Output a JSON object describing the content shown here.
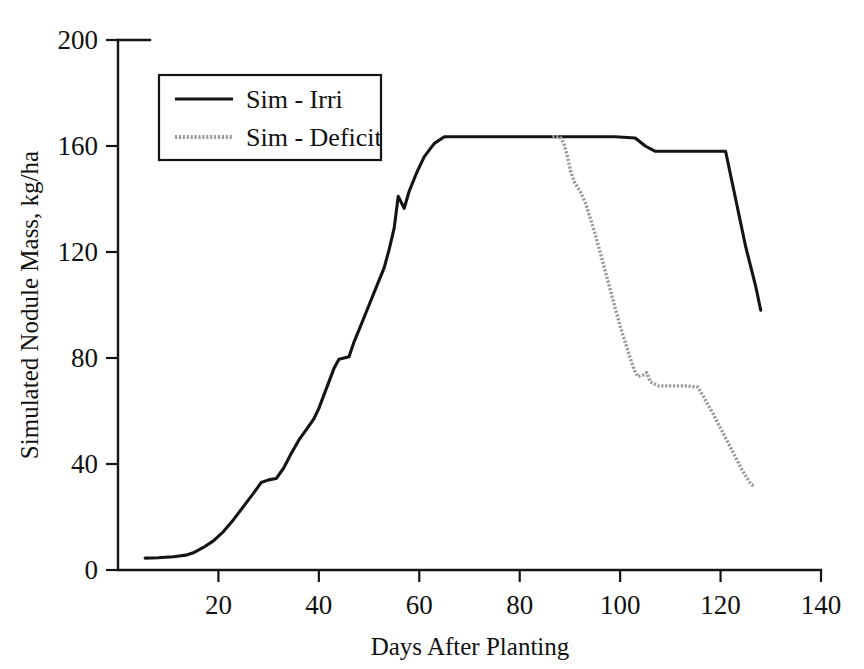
{
  "chart_data": {
    "type": "line",
    "title": "",
    "xlabel": "Days After Planting",
    "ylabel": "Simulated Nodule Mass, kg/ha",
    "xlim": [
      0,
      140
    ],
    "ylim": [
      0,
      200
    ],
    "xticks": [
      0,
      20,
      40,
      60,
      80,
      100,
      120,
      140
    ],
    "xtick_labels": [
      "0",
      "20",
      "40",
      "60",
      "80",
      "100",
      "120",
      "140"
    ],
    "yticks": [
      0,
      40,
      80,
      120,
      160,
      200
    ],
    "ytick_labels": [
      "0",
      "40",
      "80",
      "120",
      "160",
      "200"
    ],
    "grid": false,
    "legend_position": "upper left",
    "series": [
      {
        "name": "Sim - Irri",
        "style": "solid",
        "color": "#141414",
        "points": [
          [
            5.4,
            4.5
          ],
          [
            8,
            4.6
          ],
          [
            11,
            5.0
          ],
          [
            13.5,
            5.6
          ],
          [
            15,
            6.5
          ],
          [
            17,
            8.5
          ],
          [
            19,
            11.0
          ],
          [
            21,
            14.5
          ],
          [
            23,
            19.0
          ],
          [
            25,
            24.0
          ],
          [
            27,
            29.0
          ],
          [
            28.5,
            33.0
          ],
          [
            30,
            34.0
          ],
          [
            31.5,
            34.5
          ],
          [
            33,
            38.5
          ],
          [
            34.5,
            44.0
          ],
          [
            36,
            49.0
          ],
          [
            37.5,
            53.0
          ],
          [
            39,
            57.0
          ],
          [
            40,
            61.0
          ],
          [
            41,
            66.0
          ],
          [
            42,
            71.0
          ],
          [
            43,
            76.0
          ],
          [
            44,
            79.5
          ],
          [
            45,
            80.0
          ],
          [
            46,
            80.5
          ],
          [
            47,
            86.0
          ],
          [
            48.5,
            93.0
          ],
          [
            50,
            100.0
          ],
          [
            51.5,
            107.0
          ],
          [
            53,
            114.0
          ],
          [
            54,
            121.0
          ],
          [
            55,
            129.0
          ],
          [
            55.8,
            141.0
          ],
          [
            57,
            136.5
          ],
          [
            58,
            143.0
          ],
          [
            59.5,
            150.0
          ],
          [
            61,
            156.0
          ],
          [
            63,
            161.0
          ],
          [
            65,
            163.5
          ],
          [
            68,
            163.5
          ],
          [
            72,
            163.5
          ],
          [
            78,
            163.5
          ],
          [
            84,
            163.5
          ],
          [
            88,
            163.5
          ],
          [
            94,
            163.5
          ],
          [
            99,
            163.5
          ],
          [
            103,
            163.0
          ],
          [
            105,
            160.0
          ],
          [
            107,
            158.0
          ],
          [
            112,
            158.0
          ],
          [
            117,
            158.0
          ],
          [
            121,
            158.0
          ],
          [
            123,
            140.0
          ],
          [
            125,
            122.0
          ],
          [
            127,
            107.0
          ],
          [
            128,
            98.0
          ]
        ]
      },
      {
        "name": "Sim - Deficit",
        "style": "dotted",
        "color": "#9a9a9a",
        "points": [
          [
            86.5,
            163.5
          ],
          [
            88.0,
            163.5
          ],
          [
            88.8,
            161.0
          ],
          [
            89.5,
            156.0
          ],
          [
            90.2,
            150.0
          ],
          [
            91.0,
            146.0
          ],
          [
            92.0,
            143.0
          ],
          [
            93.0,
            139.0
          ],
          [
            94.0,
            133.0
          ],
          [
            95.0,
            127.0
          ],
          [
            96.0,
            120.0
          ],
          [
            97.0,
            113.0
          ],
          [
            98.0,
            106.0
          ],
          [
            99.0,
            99.0
          ],
          [
            100.0,
            92.0
          ],
          [
            101.0,
            86.0
          ],
          [
            102.0,
            80.0
          ],
          [
            102.8,
            75.5
          ],
          [
            103.5,
            73.0
          ],
          [
            104.5,
            73.5
          ],
          [
            105.3,
            74.5
          ],
          [
            106.0,
            71.0
          ],
          [
            107.5,
            69.5
          ],
          [
            110,
            69.5
          ],
          [
            113,
            69.5
          ],
          [
            115.5,
            69.0
          ],
          [
            117,
            64.0
          ],
          [
            118.5,
            59.0
          ],
          [
            120,
            53.5
          ],
          [
            121.5,
            48.0
          ],
          [
            123,
            42.5
          ],
          [
            124.5,
            37.0
          ],
          [
            126,
            32.5
          ],
          [
            126.8,
            31.5
          ]
        ]
      }
    ]
  },
  "legend": {
    "items": [
      {
        "label": "Sim - Irri",
        "style": "solid"
      },
      {
        "label": "Sim - Deficit",
        "style": "dotted"
      }
    ]
  }
}
